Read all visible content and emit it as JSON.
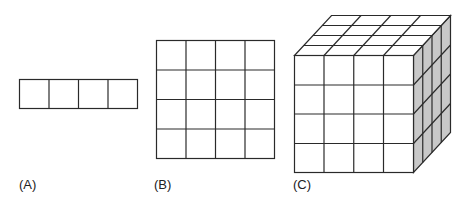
{
  "figures": [
    {
      "id": "A",
      "label": "(A)",
      "description": "1 x 4 row of squares",
      "rows": 1,
      "cols": 4
    },
    {
      "id": "B",
      "label": "(B)",
      "description": "4 x 4 grid of squares",
      "rows": 4,
      "cols": 4
    },
    {
      "id": "C",
      "label": "(C)",
      "description": "4 x 4 x 4 cube",
      "rows": 4,
      "cols": 4,
      "depth": 4
    }
  ],
  "colors": {
    "line": "#2a2a2a",
    "face_front": "#ffffff",
    "face_top": "#ffffff",
    "face_side": "#c8c8c8",
    "background": "#ffffff"
  }
}
